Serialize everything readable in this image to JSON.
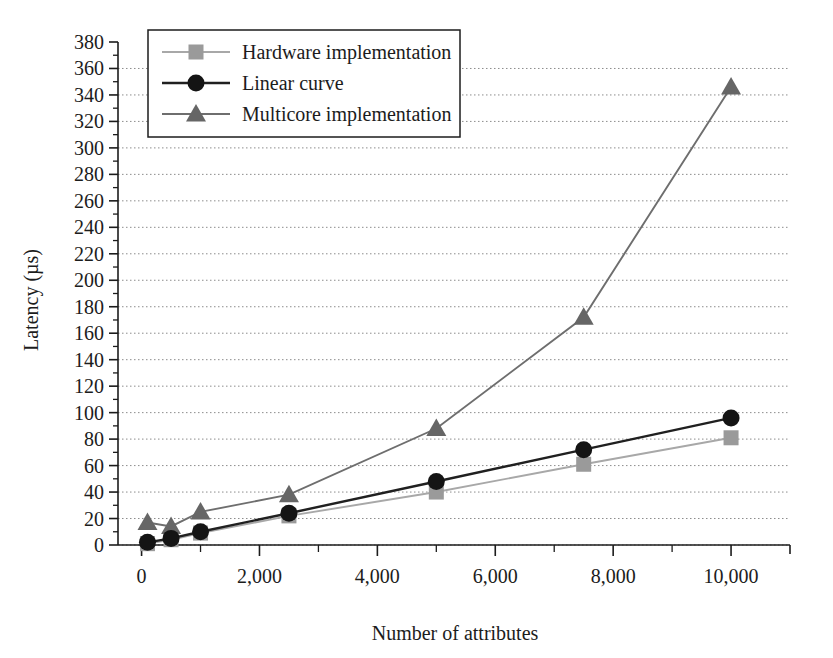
{
  "chart_data": {
    "type": "line",
    "title": "",
    "xlabel": "Number of attributes",
    "ylabel": "Latency (µs)",
    "xlim": [
      -400,
      11000
    ],
    "ylim": [
      0,
      380
    ],
    "grid": true,
    "legend_position": "top-left",
    "x_major_ticks": [
      0,
      2000,
      4000,
      6000,
      8000,
      10000
    ],
    "x_major_tick_labels": [
      "0",
      "2,000",
      "4,000",
      "6,000",
      "8,000",
      "10,000"
    ],
    "x_minor_ticks": [
      1000,
      3000,
      5000,
      7000,
      9000
    ],
    "y_major_ticks": [
      0,
      20,
      40,
      60,
      80,
      100,
      120,
      140,
      160,
      180,
      200,
      220,
      240,
      260,
      280,
      300,
      320,
      340,
      360,
      380
    ],
    "y_major_tick_labels": [
      "0",
      "20",
      "40",
      "60",
      "80",
      "100",
      "120",
      "140",
      "160",
      "180",
      "200",
      "220",
      "240",
      "260",
      "280",
      "300",
      "320",
      "340",
      "360",
      "380"
    ],
    "y_minor_ticks": [
      10,
      30,
      50,
      70,
      90,
      110,
      130,
      150,
      170,
      190,
      210,
      230,
      250,
      270,
      290,
      310,
      330,
      350,
      370
    ],
    "x": [
      100,
      500,
      1000,
      2500,
      5000,
      7500,
      10000
    ],
    "series": [
      {
        "name": "Hardware implementation",
        "marker": "square",
        "color": "#9a9a9a",
        "line_color": "#a8a8a8",
        "values": [
          1,
          4,
          9,
          22,
          40,
          61,
          81
        ]
      },
      {
        "name": "Linear curve",
        "marker": "circle",
        "color": "#141414",
        "line_color": "#202020",
        "values": [
          2,
          5,
          10,
          24,
          48,
          72,
          96
        ]
      },
      {
        "name": "Multicore implementation",
        "marker": "triangle",
        "color": "#666666",
        "line_color": "#6e6e6e",
        "values": [
          17,
          14,
          25,
          38,
          88,
          172,
          346
        ]
      }
    ]
  },
  "legend": {
    "items": [
      {
        "label": "Hardware implementation"
      },
      {
        "label": "Linear curve"
      },
      {
        "label": "Multicore implementation"
      }
    ]
  },
  "axes": {
    "x_title": "Number of attributes",
    "y_title": "Latency (µs)"
  }
}
